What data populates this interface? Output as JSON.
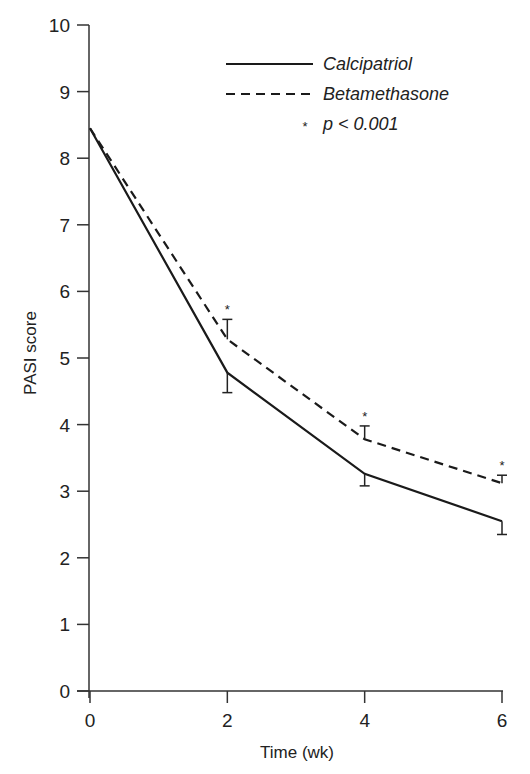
{
  "chart_data": {
    "type": "line",
    "title": "",
    "xlabel": "Time (wk)",
    "ylabel": "PASI score",
    "x": [
      0,
      2,
      4,
      6
    ],
    "x_ticks": [
      "0",
      "2",
      "4",
      "6"
    ],
    "y_ticks": [
      "0",
      "1",
      "2",
      "3",
      "4",
      "5",
      "6",
      "7",
      "8",
      "9",
      "10"
    ],
    "xlim": [
      0,
      6
    ],
    "ylim": [
      0,
      10
    ],
    "grid": false,
    "legend_position": "upper right",
    "series": [
      {
        "name": "Calcipatriol",
        "style": "solid",
        "values": [
          8.45,
          4.78,
          3.26,
          2.55
        ],
        "error_direction": "down",
        "error": [
          null,
          0.3,
          0.18,
          0.2
        ]
      },
      {
        "name": "Betamethasone",
        "style": "dashed",
        "values": [
          8.45,
          5.28,
          3.78,
          3.12
        ],
        "error_direction": "up",
        "error": [
          null,
          0.3,
          0.2,
          0.12
        ]
      }
    ],
    "annotations": [
      {
        "x": 2,
        "text": "*"
      },
      {
        "x": 4,
        "text": "*"
      },
      {
        "x": 6,
        "text": "*"
      }
    ],
    "significance_note": "* p < 0.001"
  },
  "legend": {
    "items": [
      {
        "label": "Calcipatriol",
        "style": "solid"
      },
      {
        "label": "Betamethasone",
        "style": "dashed"
      }
    ],
    "note_star": "*",
    "note_text": "p < 0.001"
  },
  "axes": {
    "xlabel": "Time (wk)",
    "ylabel": "PASI score",
    "x_ticks": [
      "0",
      "2",
      "4",
      "6"
    ],
    "y_ticks": [
      "0",
      "1",
      "2",
      "3",
      "4",
      "5",
      "6",
      "7",
      "8",
      "9",
      "10"
    ]
  },
  "colors": {
    "line": "#1a1a1a",
    "axis": "#333333",
    "background": "#ffffff"
  }
}
